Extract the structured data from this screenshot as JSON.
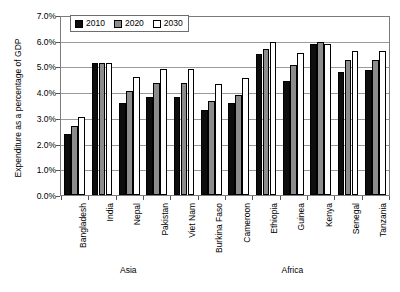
{
  "chart_data": {
    "type": "bar",
    "title": "",
    "xlabel": "",
    "ylabel": "Expenditure as a percentage of GDP",
    "ylim": [
      0,
      7
    ],
    "yticks": [
      "0.0%",
      "1.0%",
      "2.0%",
      "3.0%",
      "4.0%",
      "5.0%",
      "6.0%",
      "7.0%"
    ],
    "ytick_values": [
      0,
      1,
      2,
      3,
      4,
      5,
      6,
      7
    ],
    "grid": true,
    "legend_position": "top-left",
    "categories": [
      "Bangladesh",
      "India",
      "Nepal",
      "Pakistan",
      "Viet Nam",
      "Burkina Faso",
      "Cameroon",
      "Ethiopia",
      "Guinea",
      "Kenya",
      "Senegal",
      "Tanzania"
    ],
    "regions": [
      {
        "label": "Asia",
        "start": 0,
        "end": 4
      },
      {
        "label": "Africa",
        "start": 5,
        "end": 11
      }
    ],
    "series": [
      {
        "name": "2010",
        "color": "#0d0d0d",
        "values": [
          2.4,
          5.2,
          3.6,
          3.85,
          3.85,
          3.35,
          3.6,
          5.55,
          4.5,
          5.95,
          4.85,
          4.9
        ]
      },
      {
        "name": "2020",
        "color": "#8c8c8c",
        "values": [
          2.7,
          5.2,
          4.1,
          4.4,
          4.4,
          3.7,
          3.95,
          5.75,
          5.1,
          6.0,
          5.3,
          5.3
        ]
      },
      {
        "name": "2030",
        "color": "#ffffff",
        "values": [
          3.05,
          5.2,
          4.65,
          4.95,
          4.95,
          4.35,
          4.6,
          6.0,
          5.6,
          5.95,
          5.65,
          5.65
        ]
      }
    ]
  }
}
